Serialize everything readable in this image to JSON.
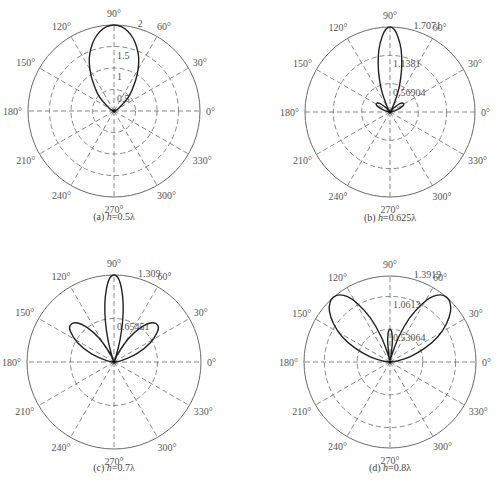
{
  "chart_data": [
    {
      "id": "a",
      "type": "polar-line",
      "caption_prefix": "(a)",
      "caption_var": "h",
      "caption_value": "=0.5λ",
      "rmax": 2,
      "rticks": [
        0.5,
        1,
        1.5,
        2
      ],
      "rtick_labels": [
        "0.5",
        "1",
        "1.5",
        "2"
      ],
      "angle_ticks": [
        0,
        30,
        60,
        90,
        120,
        150,
        180,
        210,
        240,
        270,
        300,
        330
      ],
      "angle_labels": [
        "0°",
        "30°",
        "60°",
        "90°",
        "120°",
        "150°",
        "180°",
        "210°",
        "240°",
        "270°",
        "300°",
        "330°"
      ],
      "center": [
        114,
        111
      ],
      "radius": 86,
      "series": {
        "angles": [
          0,
          30,
          45,
          55,
          60,
          65,
          70,
          75,
          80,
          85,
          90,
          95,
          100,
          105,
          110,
          115,
          120,
          125,
          135,
          150,
          180
        ],
        "values": [
          0,
          0.12,
          0.5,
          0.88,
          1.12,
          1.36,
          1.56,
          1.74,
          1.88,
          1.97,
          2.0,
          1.97,
          1.88,
          1.74,
          1.56,
          1.36,
          1.12,
          0.88,
          0.5,
          0.12,
          0
        ]
      }
    },
    {
      "id": "b",
      "type": "polar-line",
      "caption_prefix": "(b)",
      "caption_var": "h",
      "caption_value": "=0.625λ",
      "rmax": 1.7071,
      "rticks": [
        0.56904,
        1.1381,
        1.7071
      ],
      "rtick_labels": [
        "0.56904",
        "1.1381",
        "1.7071"
      ],
      "angle_ticks": [
        0,
        30,
        60,
        90,
        120,
        150,
        180,
        210,
        240,
        270,
        300,
        330
      ],
      "angle_labels": [
        "0°",
        "30°",
        "60°",
        "90°",
        "120°",
        "150°",
        "180°",
        "210°",
        "240°",
        "270°",
        "300°",
        "330°"
      ],
      "center": [
        390,
        112
      ],
      "radius": 85,
      "series": {
        "angles": [
          0,
          15,
          25,
          32,
          40,
          48,
          55,
          62,
          68,
          72,
          76,
          80,
          84,
          87,
          90,
          93,
          96,
          100,
          104,
          108,
          112,
          118,
          125,
          132,
          140,
          148,
          155,
          165,
          180
        ],
        "values": [
          0,
          0.12,
          0.28,
          0.32,
          0.26,
          0.1,
          0.02,
          0.12,
          0.42,
          0.68,
          0.98,
          1.28,
          1.52,
          1.66,
          1.7071,
          1.66,
          1.52,
          1.28,
          0.98,
          0.68,
          0.42,
          0.12,
          0.02,
          0.1,
          0.26,
          0.32,
          0.28,
          0.12,
          0
        ]
      }
    },
    {
      "id": "c",
      "type": "polar-line",
      "caption_prefix": "(c)",
      "caption_var": "h",
      "caption_value": "=0.7λ",
      "rmax": 1.309,
      "rticks": [
        0.65451,
        1.309
      ],
      "rtick_labels": [
        "0.65451",
        "1.309"
      ],
      "angle_ticks": [
        0,
        30,
        60,
        90,
        120,
        150,
        180,
        210,
        240,
        270,
        300,
        330
      ],
      "angle_labels": [
        "0°",
        "30°",
        "60°",
        "90°",
        "120°",
        "150°",
        "180°",
        "210°",
        "240°",
        "270°",
        "300°",
        "330°"
      ],
      "center": [
        114,
        362
      ],
      "radius": 87,
      "series": {
        "angles": [
          0,
          10,
          20,
          28,
          35,
          40,
          46,
          52,
          58,
          64,
          69,
          72,
          75,
          78,
          81,
          84,
          87,
          90,
          93,
          96,
          99,
          102,
          105,
          108,
          111,
          116,
          122,
          128,
          134,
          140,
          145,
          152,
          160,
          170,
          180
        ],
        "values": [
          0,
          0.1,
          0.36,
          0.62,
          0.8,
          0.86,
          0.82,
          0.66,
          0.42,
          0.16,
          0.02,
          0.14,
          0.36,
          0.62,
          0.88,
          1.1,
          1.26,
          1.309,
          1.26,
          1.1,
          0.88,
          0.62,
          0.36,
          0.14,
          0.02,
          0.16,
          0.42,
          0.66,
          0.82,
          0.86,
          0.8,
          0.62,
          0.36,
          0.1,
          0
        ]
      }
    },
    {
      "id": "d",
      "type": "polar-line",
      "caption_prefix": "(d)",
      "caption_var": "h",
      "caption_value": "=0.8λ",
      "rmax": 1.3919,
      "rticks": [
        0.53064,
        1.0613,
        1.3919
      ],
      "rtick_labels": [
        "0.53064",
        "1.0613",
        "1.3919"
      ],
      "angle_ticks": [
        0,
        30,
        60,
        90,
        120,
        150,
        180,
        210,
        240,
        270,
        300,
        330
      ],
      "angle_labels": [
        "0°",
        "30°",
        "60°",
        "90°",
        "120°",
        "150°",
        "180°",
        "210°",
        "240°",
        "270°",
        "300°",
        "330°"
      ],
      "center": [
        390,
        362
      ],
      "radius": 86,
      "series": {
        "angles": [
          0,
          8,
          15,
          22,
          28,
          34,
          40,
          45,
          49,
          53,
          57,
          61,
          66,
          71,
          76,
          80,
          83,
          86,
          88,
          90,
          92,
          94,
          97,
          100,
          104,
          109,
          114,
          119,
          123,
          127,
          131,
          135,
          140,
          146,
          152,
          158,
          165,
          172,
          180
        ],
        "values": [
          0,
          0.12,
          0.34,
          0.62,
          0.88,
          1.1,
          1.28,
          1.37,
          1.3919,
          1.36,
          1.26,
          1.08,
          0.78,
          0.42,
          0.1,
          0.06,
          0.3,
          0.46,
          0.51,
          0.53,
          0.51,
          0.46,
          0.3,
          0.06,
          0.1,
          0.42,
          0.78,
          1.08,
          1.26,
          1.36,
          1.3919,
          1.37,
          1.28,
          1.1,
          0.88,
          0.62,
          0.34,
          0.12,
          0
        ]
      }
    }
  ],
  "figure": {
    "caption_y_offset": 109,
    "title": ""
  }
}
